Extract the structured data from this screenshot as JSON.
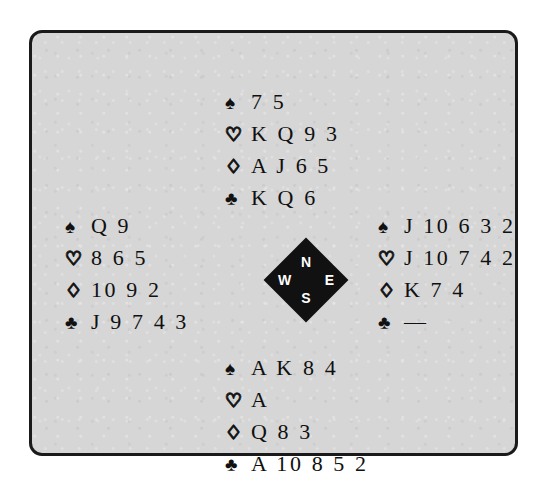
{
  "diagram": {
    "type": "bridge-deal",
    "suit_glyphs": {
      "spades": "♠",
      "hearts": "♡",
      "diamonds": "♢",
      "clubs": "♣"
    },
    "void_marker": "—",
    "compass": {
      "north": "N",
      "west": "W",
      "east": "E",
      "south": "S",
      "fill_color": "#111111",
      "label_color": "#ffffff"
    },
    "background_color": "#d6d6d6",
    "border_color": "#1a1a1a",
    "hands": {
      "north": {
        "spades": "7 5",
        "hearts": "K Q 9 3",
        "diamonds": "A J 6 5",
        "clubs": "K Q 6"
      },
      "west": {
        "spades": "Q 9",
        "hearts": "8 6 5",
        "diamonds": "10 9 2",
        "clubs": "J 9 7 4 3"
      },
      "east": {
        "spades": "J 10 6 3 2",
        "hearts": "J 10 7 4 2",
        "diamonds": "K 7 4",
        "clubs": "—"
      },
      "south": {
        "spades": "A K 8 4",
        "hearts": "A",
        "diamonds": "Q 8 3",
        "clubs": "A 10 8 5 2"
      }
    }
  }
}
